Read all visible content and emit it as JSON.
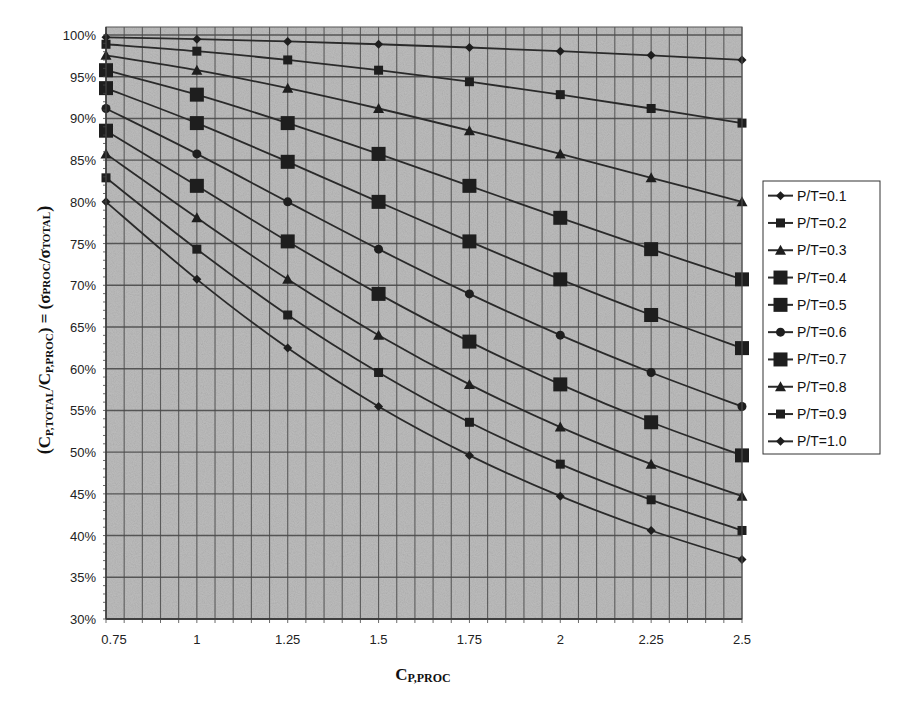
{
  "chart_data": {
    "type": "line",
    "title": "",
    "xlabel": "CP,PROC",
    "xlabel_parts": {
      "main": "C",
      "sub": "P,PROC"
    },
    "ylabel": "(CP,TOTAL/CP,PROC) = (σPROC/σTOTAL)",
    "ylabel_parts": {
      "open": "(",
      "c1": "C",
      "c1_sub": "P,TOTAL",
      "slash": "/",
      "c2": "C",
      "c2_sub": "P,PROC",
      "eq": ") = (",
      "s1": "σ",
      "s1_sub": "PROC",
      "slash2": "/",
      "s2": "σ",
      "s2_sub": "TOTAL",
      "close": ")"
    },
    "x": [
      0.75,
      1,
      1.25,
      1.5,
      1.75,
      2,
      2.25,
      2.5
    ],
    "x_tick_labels": [
      "0.75",
      "1",
      "1.25",
      "1.5",
      "1.75",
      "2",
      "2.25",
      "2.5"
    ],
    "xlim": [
      0.75,
      2.5
    ],
    "ylim": [
      0.3,
      1.0
    ],
    "y_ticks": [
      1.0,
      0.95,
      0.9,
      0.85,
      0.8,
      0.75,
      0.7,
      0.65,
      0.6,
      0.55,
      0.5,
      0.45,
      0.4,
      0.35,
      0.3
    ],
    "y_tick_labels": [
      "100%",
      "95%",
      "90%",
      "85%",
      "80%",
      "75%",
      "70%",
      "65%",
      "60%",
      "55%",
      "50%",
      "45%",
      "40%",
      "35%",
      "30%"
    ],
    "grid": {
      "major_y_step": 0.05,
      "minor_x_step": 0.05,
      "minor_y_ticks_step": 0.01
    },
    "legend_position": "right",
    "series": [
      {
        "name": "P/T=0.1",
        "marker": "diamond",
        "size": "small",
        "values": [
          0.9972,
          0.995,
          0.9923,
          0.9889,
          0.985,
          0.9806,
          0.9756,
          0.9701
        ]
      },
      {
        "name": "P/T=0.2",
        "marker": "square",
        "size": "small",
        "values": [
          0.9889,
          0.9806,
          0.9701,
          0.9578,
          0.944,
          0.9285,
          0.9119,
          0.8944
        ]
      },
      {
        "name": "P/T=0.3",
        "marker": "triangle",
        "size": "small",
        "values": [
          0.9756,
          0.9578,
          0.9363,
          0.9119,
          0.8853,
          0.8575,
          0.8288,
          0.8
        ]
      },
      {
        "name": "P/T=0.4",
        "marker": "square",
        "size": "large",
        "values": [
          0.9578,
          0.9285,
          0.8944,
          0.8575,
          0.8192,
          0.7809,
          0.7433,
          0.7071
        ]
      },
      {
        "name": "P/T=0.5",
        "marker": "square",
        "size": "large",
        "values": [
          0.9363,
          0.8944,
          0.848,
          0.8,
          0.7526,
          0.7071,
          0.6644,
          0.6247
        ]
      },
      {
        "name": "P/T=0.6",
        "marker": "circle",
        "size": "small",
        "values": [
          0.9119,
          0.8575,
          0.8,
          0.7433,
          0.6897,
          0.6402,
          0.5955,
          0.5547
        ]
      },
      {
        "name": "P/T=0.7",
        "marker": "square",
        "size": "large",
        "values": [
          0.8853,
          0.8192,
          0.7526,
          0.6897,
          0.6325,
          0.5812,
          0.5358,
          0.4961
        ]
      },
      {
        "name": "P/T=0.8",
        "marker": "triangle",
        "size": "small",
        "values": [
          0.8575,
          0.7809,
          0.7071,
          0.6402,
          0.5812,
          0.53,
          0.4856,
          0.4472
        ]
      },
      {
        "name": "P/T=0.9",
        "marker": "square",
        "size": "small",
        "values": [
          0.8288,
          0.7433,
          0.6644,
          0.5955,
          0.5358,
          0.4856,
          0.4429,
          0.4061
        ]
      },
      {
        "name": "P/T=1.0",
        "marker": "diamond",
        "size": "small",
        "values": [
          0.8,
          0.7071,
          0.6247,
          0.5547,
          0.4961,
          0.4472,
          0.4061,
          0.3714
        ]
      }
    ]
  },
  "colors": {
    "plot_background": "#bdbdbd",
    "gridline": "#4a4a4a",
    "series_line": "#2a2a2a",
    "marker": "#1e1e1e",
    "legend_border": "#333333"
  }
}
